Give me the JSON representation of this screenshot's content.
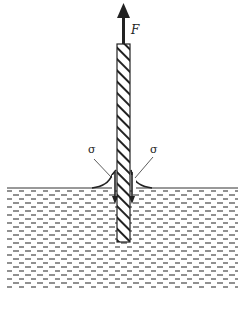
{
  "diagram": {
    "force": {
      "label": "F",
      "direction": "up"
    },
    "surface_tension": {
      "left_label": "σ",
      "right_label": "σ"
    },
    "colors": {
      "line": "#222222",
      "liquid_dash": "#555555",
      "background": "#ffffff"
    }
  }
}
